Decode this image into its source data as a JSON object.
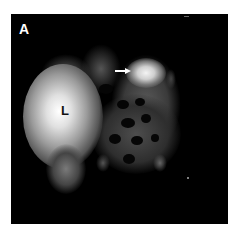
{
  "figure": {
    "panel_label": "A",
    "organ_label": "L",
    "arrow_indicator": "arrow pointing right at focal uptake",
    "colors": {
      "background": "#000000",
      "border": "#ffffff",
      "uptake_bright": "#f2f2f2",
      "uptake_mid": "#8a8a8a",
      "uptake_dim": "#4a4a4a"
    }
  }
}
